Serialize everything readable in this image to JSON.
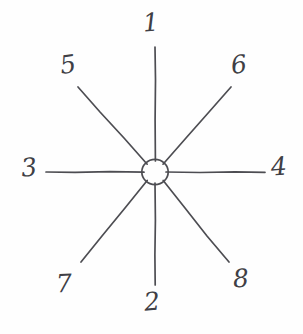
{
  "figure": {
    "type": "spoke-diagram",
    "background_color": "#fefefe",
    "stroke_color": "#4d4d52",
    "label_color": "#3f3f45",
    "center": {
      "x": 155,
      "y": 172
    },
    "hub": {
      "radius": 13
    }
  },
  "spokes": [
    {
      "id": "spoke-1",
      "label": "1",
      "direction": "up",
      "angle_deg": 90,
      "x1": 155,
      "y1": 161,
      "x2": 155,
      "y2": 47
    },
    {
      "id": "spoke-2",
      "label": "2",
      "direction": "down",
      "angle_deg": 270,
      "x1": 155,
      "y1": 183,
      "x2": 155,
      "y2": 285
    },
    {
      "id": "spoke-3",
      "label": "3",
      "direction": "left",
      "angle_deg": 180,
      "x1": 144,
      "y1": 172,
      "x2": 46,
      "y2": 172
    },
    {
      "id": "spoke-4",
      "label": "4",
      "direction": "right",
      "angle_deg": 0,
      "x1": 166,
      "y1": 172,
      "x2": 265,
      "y2": 172
    },
    {
      "id": "spoke-5",
      "label": "5",
      "direction": "up-left",
      "angle_deg": 135,
      "x1": 147,
      "y1": 164,
      "x2": 78,
      "y2": 87
    },
    {
      "id": "spoke-6",
      "label": "6",
      "direction": "up-right",
      "angle_deg": 45,
      "x1": 163,
      "y1": 164,
      "x2": 231,
      "y2": 87
    },
    {
      "id": "spoke-7",
      "label": "7",
      "direction": "down-left",
      "angle_deg": 225,
      "x1": 147,
      "y1": 181,
      "x2": 81,
      "y2": 262
    },
    {
      "id": "spoke-8",
      "label": "8",
      "direction": "down-right",
      "angle_deg": 315,
      "x1": 163,
      "y1": 181,
      "x2": 229,
      "y2": 262
    }
  ],
  "labels": {
    "n1": "1",
    "n2": "2",
    "n3": "3",
    "n4": "4",
    "n5": "5",
    "n6": "6",
    "n7": "7",
    "n8": "8"
  }
}
